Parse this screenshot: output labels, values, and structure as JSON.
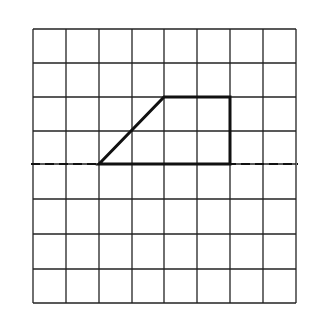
{
  "diagram": {
    "type": "grid-figure",
    "grid": {
      "columns": 8,
      "rows": 8,
      "x_lines": [
        33,
        66,
        99,
        132,
        164,
        197,
        230,
        263,
        296
      ],
      "y_lines": [
        29,
        63,
        97,
        131,
        164,
        199,
        234,
        269,
        303
      ],
      "line_color": "#222222"
    },
    "axis_line": {
      "style": "dashed",
      "y": 164,
      "x_start": 31,
      "x_end": 298,
      "description": "horizontal line of symmetry"
    },
    "shape": {
      "name": "trapezoid",
      "points": [
        [
          99,
          164
        ],
        [
          164,
          97
        ],
        [
          230,
          97
        ],
        [
          230,
          164
        ]
      ],
      "grid_points": [
        [
          2,
          4
        ],
        [
          4,
          2
        ],
        [
          6,
          2
        ],
        [
          6,
          4
        ]
      ],
      "stroke_color": "#111111"
    }
  }
}
